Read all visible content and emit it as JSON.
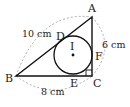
{
  "diagram": {
    "type": "right-triangle-with-incircle",
    "points": {
      "A": {
        "label": "A",
        "x": 92,
        "y": 17
      },
      "B": {
        "label": "B",
        "x": 16,
        "y": 76
      },
      "C": {
        "label": "C",
        "x": 92,
        "y": 76
      },
      "D": {
        "label": "D",
        "x": 64,
        "y": 38
      },
      "E": {
        "label": "E",
        "x": 73,
        "y": 76
      },
      "F": {
        "label": "F",
        "x": 92,
        "y": 55
      },
      "I": {
        "label": "I",
        "x": 73,
        "y": 55
      }
    },
    "incircle": {
      "center": "I",
      "radius": 19
    },
    "right_angle_at": "C",
    "dimensions": {
      "AB": "10 cm",
      "AC": "6 cm",
      "BC": "8 cm"
    },
    "colors": {
      "line": "#111111",
      "dashed": "#999999"
    }
  }
}
